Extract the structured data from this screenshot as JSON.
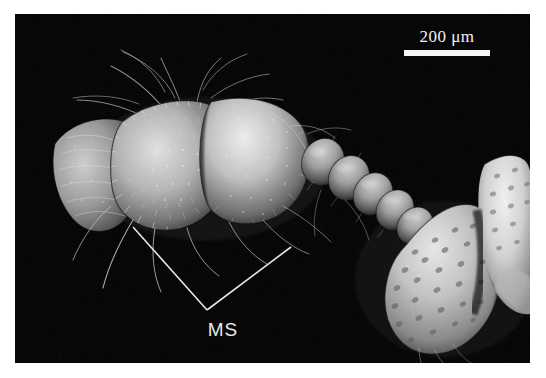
{
  "figure": {
    "kind": "sem-micrograph",
    "border_color": "#ffffff",
    "background_color": "#000000",
    "specimen_description": "Scanning electron micrograph of an insect antenna showing scape and pedicel with dense setae, a chain of rounded funicular segments, and part of the punctate head capsule at lower right"
  },
  "scale_bar": {
    "value": "200",
    "unit": "μm",
    "label": "200 μm",
    "color": "#f5f5f5",
    "bar_length_px": 86,
    "position": "top-right"
  },
  "annotation": {
    "label": "MS",
    "color": "#e8e8e8",
    "leader_type": "v-shaped-bracket",
    "leader_left_start": "133,227",
    "leader_vertex": "207,310",
    "leader_right_end": "291,247"
  },
  "colors": {
    "frame": "#ffffff",
    "field": "#000000",
    "annotation": "#e8e8e8",
    "scalebar": "#f5f5f5",
    "specimen_light": "#d8d8d8",
    "specimen_mid": "#8c8c8c",
    "specimen_dark": "#3a3a3a"
  }
}
